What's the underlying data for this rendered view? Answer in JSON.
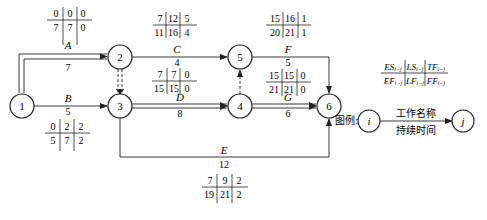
{
  "diagram": {
    "type": "double-code network diagram (activity-on-arrow)",
    "nodes": [
      {
        "id": "1",
        "label": "1"
      },
      {
        "id": "2",
        "label": "2"
      },
      {
        "id": "3",
        "label": "3"
      },
      {
        "id": "4",
        "label": "4"
      },
      {
        "id": "5",
        "label": "5"
      },
      {
        "id": "6",
        "label": "6"
      }
    ],
    "activities": [
      {
        "name": "A",
        "from": "1",
        "to": "2",
        "duration": "7",
        "critical": true,
        "ES": "0",
        "LS": "0",
        "TF": "0",
        "EF": "7",
        "LF": "7",
        "FF": "0"
      },
      {
        "name": "B",
        "from": "1",
        "to": "3",
        "duration": "5",
        "critical": false,
        "ES": "0",
        "LS": "2",
        "TF": "2",
        "EF": "5",
        "LF": "7",
        "FF": "2"
      },
      {
        "name": "C",
        "from": "2",
        "to": "5",
        "duration": "4",
        "critical": false,
        "ES": "7",
        "LS": "12",
        "TF": "5",
        "EF": "11",
        "LF": "16",
        "FF": "4"
      },
      {
        "name": "D",
        "from": "3",
        "to": "4",
        "duration": "8",
        "critical": true,
        "ES": "7",
        "LS": "7",
        "TF": "0",
        "EF": "15",
        "LF": "15",
        "FF": "0"
      },
      {
        "name": "E",
        "from": "3",
        "to": "6",
        "duration": "12",
        "critical": false,
        "ES": "7",
        "LS": "9",
        "TF": "2",
        "EF": "19",
        "LF": "21",
        "FF": "2"
      },
      {
        "name": "F",
        "from": "5",
        "to": "6",
        "duration": "5",
        "critical": false,
        "ES": "15",
        "LS": "16",
        "TF": "1",
        "EF": "20",
        "LF": "21",
        "FF": "1"
      },
      {
        "name": "G",
        "from": "4",
        "to": "6",
        "duration": "6",
        "critical": true,
        "ES": "15",
        "LS": "15",
        "TF": "0",
        "EF": "21",
        "LF": "21",
        "FF": "0"
      }
    ],
    "dummies": [
      {
        "from": "2",
        "to": "3",
        "critical": true
      },
      {
        "from": "4",
        "to": "5",
        "critical": false
      }
    ],
    "legend": {
      "prefix": "图例:",
      "start_node": "i",
      "end_node": "j",
      "work_name": "工作名称",
      "duration": "持续时间",
      "top_row": [
        "ES",
        "LS",
        "TF"
      ],
      "bottom_row": [
        "EF",
        "LF",
        "FF"
      ],
      "subscript": "i−j"
    },
    "colors": {
      "line": "#222222",
      "text": "#1a1a1a",
      "background": "#ffffff"
    }
  }
}
